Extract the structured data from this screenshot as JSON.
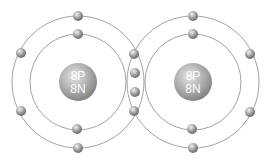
{
  "diagram": {
    "atoms": [
      {
        "id": "left-atom",
        "nucleus_line1": "8P",
        "nucleus_line2": "8N",
        "center": [
          78,
          82
        ]
      },
      {
        "id": "right-atom",
        "nucleus_line1": "8P",
        "nucleus_line2": "8N",
        "center": [
          193,
          82
        ]
      }
    ],
    "shells": {
      "inner_radius": 48,
      "outer_radius": 66
    },
    "shared_electrons": 4,
    "colors": {
      "orbit": "#8a8a8a",
      "nucleus": "#a8a8a8",
      "electron": "#9a9a9a",
      "label": "#ffffff"
    }
  }
}
